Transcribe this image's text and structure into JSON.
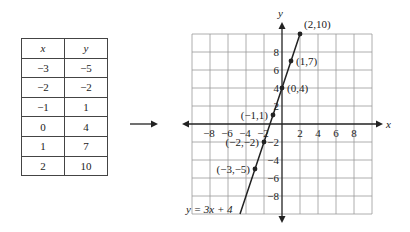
{
  "table": {
    "headers": [
      "x",
      "y"
    ],
    "rows": [
      [
        "−3",
        "−5"
      ],
      [
        "−2",
        "−2"
      ],
      [
        "−1",
        "1"
      ],
      [
        "0",
        "4"
      ],
      [
        "1",
        "7"
      ],
      [
        "2",
        "10"
      ]
    ]
  },
  "arrow": {
    "icon": "right-arrow-icon"
  },
  "graph": {
    "x_axis_label": "x",
    "y_axis_label": "y",
    "x_ticks": [
      "−8",
      "−6",
      "−4",
      "−2",
      "2",
      "4",
      "6",
      "8"
    ],
    "y_ticks": [
      "8",
      "6",
      "4",
      "2",
      "−2",
      "−4",
      "−6",
      "−8"
    ],
    "equation": "y = 3x + 4",
    "points": [
      {
        "label": "(2,10)"
      },
      {
        "label": "(1,7)"
      },
      {
        "label": "(0,4)"
      },
      {
        "label": "(−1,1)"
      },
      {
        "label": "(−2,−2)"
      },
      {
        "label": "(−3,−5)"
      }
    ]
  }
}
